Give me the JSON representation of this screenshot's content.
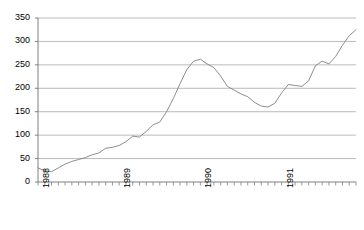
{
  "chart_data": {
    "type": "line",
    "title": "",
    "subtitle": "",
    "xlabel": "",
    "ylabel": "",
    "ylim": [
      0,
      350
    ],
    "yticks": [
      0,
      50,
      100,
      150,
      200,
      250,
      300,
      350
    ],
    "ytick_labels": [
      "0",
      "50",
      "100",
      "150",
      "200",
      "250",
      "300",
      "350"
    ],
    "xtick_labels": [
      "1988",
      "1989",
      "1990",
      "1991"
    ],
    "xtick_positions": [
      0,
      12,
      24,
      36
    ],
    "x_minor_tick_count": 48,
    "grid": true,
    "grid_axis": "y",
    "legend": false,
    "legend_position": "none",
    "line_color": "#808080",
    "grid_color": "#a9a9a9",
    "axis_color": "#808080",
    "x": [
      0,
      1,
      2,
      3,
      4,
      5,
      6,
      7,
      8,
      9,
      10,
      11,
      12,
      13,
      14,
      15,
      16,
      17,
      18,
      19,
      20,
      21,
      22,
      23,
      24,
      25,
      26,
      27,
      28,
      29,
      30,
      31,
      32,
      33,
      34,
      35,
      36,
      37,
      38,
      39,
      40,
      41,
      42,
      43,
      44,
      45,
      46,
      47
    ],
    "x_labels": [
      "1988-01",
      "1988-02",
      "1988-03",
      "1988-04",
      "1988-05",
      "1988-06",
      "1988-07",
      "1988-08",
      "1988-09",
      "1988-10",
      "1988-11",
      "1988-12",
      "1989-01",
      "1989-02",
      "1989-03",
      "1989-04",
      "1989-05",
      "1989-06",
      "1989-07",
      "1989-08",
      "1989-09",
      "1989-10",
      "1989-11",
      "1989-12",
      "1990-01",
      "1990-02",
      "1990-03",
      "1990-04",
      "1990-05",
      "1990-06",
      "1990-07",
      "1990-08",
      "1990-09",
      "1990-10",
      "1990-11",
      "1990-12",
      "1991-01",
      "1991-02",
      "1991-03",
      "1991-04",
      "1991-05",
      "1991-06",
      "1991-07",
      "1991-08",
      "1991-09",
      "1991-10",
      "1991-11",
      "1991-12"
    ],
    "values": [
      30,
      24,
      22,
      30,
      38,
      44,
      48,
      52,
      58,
      62,
      72,
      74,
      78,
      86,
      98,
      96,
      108,
      122,
      128,
      150,
      178,
      210,
      240,
      258,
      262,
      252,
      244,
      226,
      204,
      196,
      188,
      182,
      170,
      162,
      160,
      168,
      190,
      208,
      206,
      204,
      216,
      248,
      258,
      252,
      268,
      292,
      312,
      325
    ]
  }
}
